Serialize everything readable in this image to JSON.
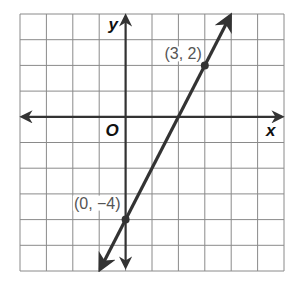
{
  "chart_data": {
    "type": "line",
    "title": "",
    "xlabel": "x",
    "ylabel": "y",
    "origin_label": "O",
    "xlim": [
      -4,
      6
    ],
    "ylim": [
      -6,
      4
    ],
    "grid": true,
    "grid_step": 1,
    "series": [
      {
        "name": "line",
        "equation": "y = 2x - 4",
        "slope": 2,
        "intercept": -4,
        "x": [
          -1,
          4
        ],
        "y": [
          -6,
          4
        ],
        "color": "#333333"
      }
    ],
    "points": [
      {
        "x": 3,
        "y": 2,
        "label": "(3, 2)"
      },
      {
        "x": 0,
        "y": -4,
        "label": "(0, −4)"
      }
    ]
  },
  "colors": {
    "grid": "#8a8a8a",
    "axis": "#333333",
    "line": "#333333",
    "label": "#555555"
  }
}
